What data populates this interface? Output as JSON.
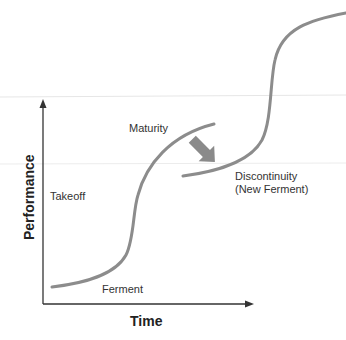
{
  "diagram": {
    "type": "s-curve technology lifecycle",
    "axes": {
      "x_label": "Time",
      "y_label": "Performance"
    },
    "phase_labels": {
      "ferment": "Ferment",
      "takeoff": "Takeoff",
      "maturity": "Maturity",
      "discontinuity_line1": "Discontinuity",
      "discontinuity_line2": "(New Ferment)"
    },
    "curves": [
      {
        "name": "Current technology S-curve"
      },
      {
        "name": "New technology S-curve"
      }
    ],
    "colors": {
      "curve": "#8c8c8c",
      "axis": "#333333",
      "shift_arrow": "#8a8a8a",
      "text": "#333333"
    }
  }
}
